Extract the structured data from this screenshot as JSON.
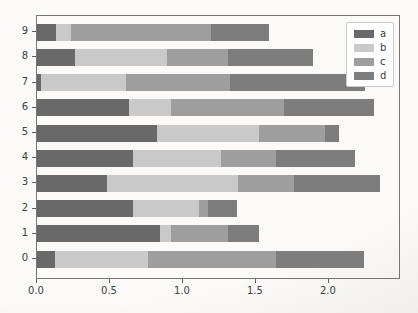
{
  "chart_data": {
    "type": "bar",
    "orientation": "horizontal",
    "stacked": true,
    "title": "",
    "xlabel": "",
    "ylabel": "",
    "grid": false,
    "legend_position": "upper right",
    "categories": [
      "0",
      "1",
      "2",
      "3",
      "4",
      "5",
      "6",
      "7",
      "8",
      "9"
    ],
    "series": [
      {
        "name": "a",
        "color": "#696969",
        "values": [
          0.12,
          0.84,
          0.66,
          0.48,
          0.66,
          0.82,
          0.63,
          0.03,
          0.26,
          0.13
        ]
      },
      {
        "name": "b",
        "color": "#c9c9c9",
        "values": [
          0.64,
          0.08,
          0.45,
          0.9,
          0.6,
          0.7,
          0.29,
          0.58,
          0.63,
          0.1
        ]
      },
      {
        "name": "c",
        "color": "#9e9e9e",
        "values": [
          0.88,
          0.39,
          0.06,
          0.38,
          0.38,
          0.45,
          0.77,
          0.71,
          0.42,
          0.96
        ]
      },
      {
        "name": "d",
        "color": "#7d7d7d",
        "values": [
          0.6,
          0.21,
          0.2,
          0.59,
          0.54,
          0.1,
          0.62,
          0.93,
          0.58,
          0.4
        ]
      }
    ],
    "bar_totals": [
      2.24,
      1.52,
      1.37,
      2.35,
      2.18,
      2.07,
      2.31,
      2.25,
      1.89,
      1.59
    ],
    "x_ticks": [
      "0.0",
      "0.5",
      "1.0",
      "1.5",
      "2.0"
    ],
    "x_tick_values": [
      0.0,
      0.5,
      1.0,
      1.5,
      2.0
    ],
    "xlim": [
      0,
      2.48
    ]
  }
}
